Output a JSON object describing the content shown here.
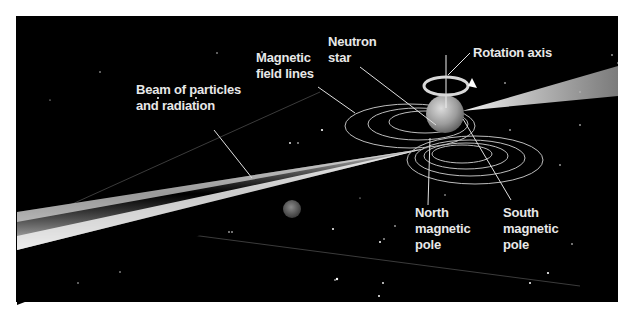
{
  "diagram": {
    "background_color": "#000000",
    "label_color": "#e8e8e8",
    "labels": {
      "beam": {
        "line1": "Beam of particles",
        "line2": "and radiation"
      },
      "field_lines": {
        "line1": "Magnetic",
        "line2": "field lines"
      },
      "neutron_star": {
        "line1": "Neutron",
        "line2": "star"
      },
      "rotation_axis": {
        "line1": "Rotation axis"
      },
      "north_pole": {
        "line1": "North",
        "line2": "magnetic",
        "line3": "pole"
      },
      "south_pole": {
        "line1": "South",
        "line2": "magnetic",
        "line3": "pole"
      }
    },
    "elements": [
      "neutron-star",
      "rotation-axis",
      "rotation-arrow",
      "magnetic-field-lines",
      "left-beam",
      "right-beam",
      "planet",
      "orbital-plane"
    ]
  }
}
